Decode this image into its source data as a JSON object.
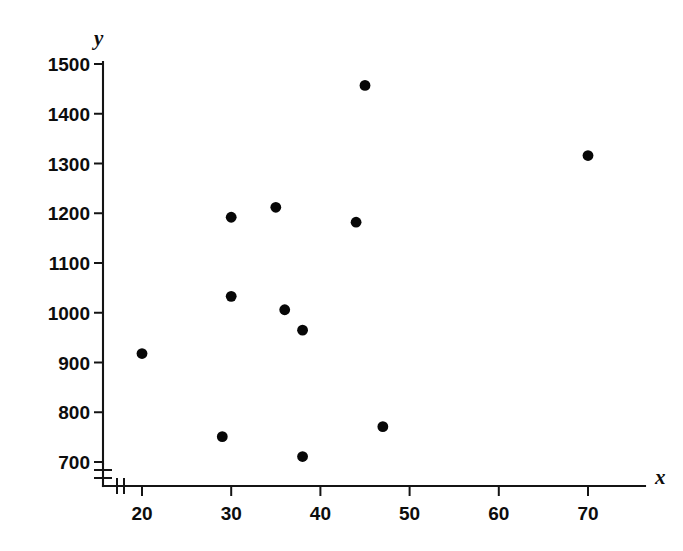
{
  "chart_data": {
    "type": "scatter",
    "title": "",
    "subtitle": "",
    "xlabel": "x",
    "ylabel": "y",
    "xlim": [
      15,
      75
    ],
    "ylim": [
      660,
      1520
    ],
    "x_ticks": [
      20,
      30,
      40,
      50,
      60,
      70
    ],
    "y_ticks": [
      700,
      800,
      900,
      1000,
      1100,
      1200,
      1300,
      1400,
      1500
    ],
    "x_tick_labels": [
      "20",
      "30",
      "40",
      "50",
      "60",
      "70"
    ],
    "y_tick_labels": [
      "700",
      "800",
      "900",
      "1000",
      "1100",
      "1200",
      "1300",
      "1400",
      "1500"
    ],
    "grid": false,
    "legend": null,
    "axis_break_x": true,
    "axis_break_y": true,
    "marker": "filled-circle",
    "marker_color": "#070707",
    "n_points": 12,
    "points": [
      {
        "x": 20,
        "y": 918
      },
      {
        "x": 29,
        "y": 751
      },
      {
        "x": 30,
        "y": 1192
      },
      {
        "x": 30,
        "y": 1033
      },
      {
        "x": 35,
        "y": 1212
      },
      {
        "x": 36,
        "y": 1006
      },
      {
        "x": 38,
        "y": 965
      },
      {
        "x": 38,
        "y": 711
      },
      {
        "x": 44,
        "y": 1182
      },
      {
        "x": 45,
        "y": 1457
      },
      {
        "x": 47,
        "y": 771
      },
      {
        "x": 70,
        "y": 1316
      }
    ]
  },
  "axes": {
    "y_axis_name": "y-axis",
    "x_axis_name": "x-axis",
    "y_title": "y",
    "x_title": "x"
  }
}
